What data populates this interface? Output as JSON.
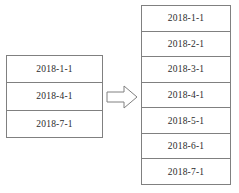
{
  "diagram": {
    "background_color": "#ffffff",
    "border_color": "#808080",
    "text_color": "#2b2b2b"
  },
  "source_table": {
    "name": "source-date-table",
    "row_count": 3,
    "rows": [
      {
        "value": "2018-1-1"
      },
      {
        "value": "2018-4-1"
      },
      {
        "value": "2018-7-1"
      }
    ]
  },
  "arrow": {
    "name": "transform-arrow",
    "direction": "right",
    "icon": "arrow-right-icon",
    "fill": "#ffffff",
    "stroke": "#808080"
  },
  "target_table": {
    "name": "target-date-table",
    "row_count": 7,
    "rows": [
      {
        "value": "2018-1-1"
      },
      {
        "value": "2018-2-1"
      },
      {
        "value": "2018-3-1"
      },
      {
        "value": "2018-4-1"
      },
      {
        "value": "2018-5-1"
      },
      {
        "value": "2018-6-1"
      },
      {
        "value": "2018-7-1"
      }
    ]
  }
}
